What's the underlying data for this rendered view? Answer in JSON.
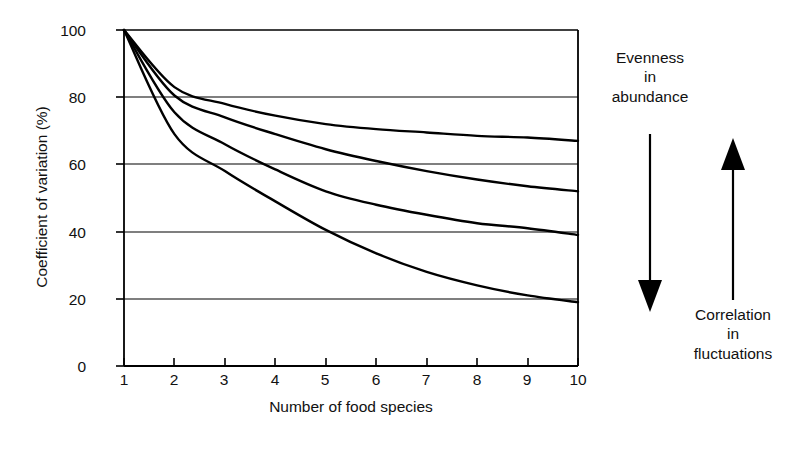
{
  "chart_data": {
    "type": "line",
    "title": "",
    "xlabel": "Number of food species",
    "ylabel": "Coefficient of variation (%)",
    "xlim": [
      1,
      10
    ],
    "ylim": [
      0,
      100
    ],
    "grid": true,
    "legend": "none",
    "x": [
      1,
      2,
      3,
      4,
      5,
      6,
      7,
      8,
      9,
      10
    ],
    "xticks": [
      "1",
      "2",
      "3",
      "4",
      "5",
      "6",
      "7",
      "8",
      "9",
      "10"
    ],
    "yticks": [
      "0",
      "20",
      "40",
      "60",
      "80",
      "100"
    ],
    "series": [
      {
        "name": "curve-1",
        "values": [
          100,
          83,
          78,
          74.5,
          72,
          70.5,
          69.5,
          68.5,
          68,
          67
        ]
      },
      {
        "name": "curve-2",
        "values": [
          100,
          80.5,
          74,
          69,
          64.5,
          61,
          58,
          55.5,
          53.5,
          52
        ]
      },
      {
        "name": "curve-3",
        "values": [
          100,
          75.5,
          66,
          58.5,
          52,
          48,
          45,
          42.5,
          41,
          39
        ]
      },
      {
        "name": "curve-4",
        "values": [
          100,
          69,
          58,
          49,
          40.5,
          33.5,
          28,
          24,
          21,
          19
        ]
      }
    ],
    "annotations": [
      {
        "name": "evenness-annotation",
        "lines": [
          "Evenness",
          "in",
          "abundance"
        ],
        "arrow": "down"
      },
      {
        "name": "correlation-annotation",
        "lines": [
          "Correlation",
          "in",
          "fluctuations"
        ],
        "arrow": "up"
      }
    ],
    "colors": {
      "line": "#000000",
      "grid": "#000000",
      "axis": "#000000",
      "background": "#ffffff"
    }
  }
}
